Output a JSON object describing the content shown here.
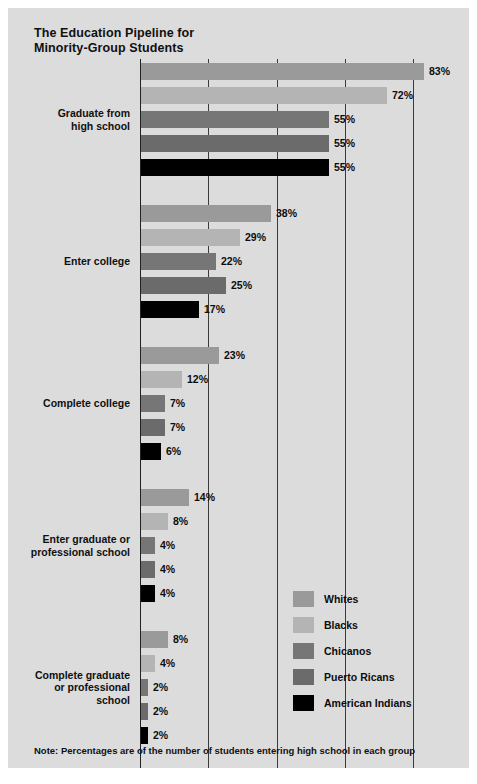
{
  "title": "The Education Pipeline for\nMinority-Group Students",
  "note": "Note: Percentages are of the number of students entering high school in each group",
  "legend": {
    "items": [
      {
        "label": "Whites",
        "color": "#9a9a9a"
      },
      {
        "label": "Blacks",
        "color": "#b4b4b4"
      },
      {
        "label": "Chicanos",
        "color": "#767676"
      },
      {
        "label": "Puerto Ricans",
        "color": "#6b6b6b"
      },
      {
        "label": "American Indians",
        "color": "#000000"
      }
    ]
  },
  "chart_data": {
    "type": "bar",
    "orientation": "horizontal",
    "title": "The Education Pipeline for Minority-Group Students",
    "xlabel": "Percent of Cohort",
    "ylabel": "",
    "xlim": [
      0,
      80
    ],
    "xticks": [
      0,
      20,
      40,
      60,
      80
    ],
    "xtick_labels": [
      "0",
      "20",
      "40",
      "60",
      "80"
    ],
    "grid": true,
    "legend_position": "bottom-right",
    "value_suffix": "%",
    "categories": [
      "Graduate from\nhigh school",
      "Enter college",
      "Complete college",
      "Enter graduate or\nprofessional school",
      "Complete graduate\nor professional\nschool"
    ],
    "series": [
      {
        "name": "Whites",
        "color": "#9a9a9a",
        "values": [
          83,
          38,
          23,
          14,
          8
        ]
      },
      {
        "name": "Blacks",
        "color": "#b4b4b4",
        "values": [
          72,
          29,
          12,
          8,
          4
        ]
      },
      {
        "name": "Chicanos",
        "color": "#767676",
        "values": [
          55,
          22,
          7,
          4,
          2
        ]
      },
      {
        "name": "Puerto Ricans",
        "color": "#6b6b6b",
        "values": [
          55,
          25,
          7,
          4,
          2
        ]
      },
      {
        "name": "American Indians",
        "color": "#000000",
        "values": [
          55,
          17,
          6,
          4,
          2
        ]
      }
    ],
    "value_labels": [
      [
        "83%",
        "72%",
        "55%",
        "55%",
        "55%"
      ],
      [
        "38%",
        "29%",
        "22%",
        "25%",
        "17%"
      ],
      [
        "23%",
        "12%",
        "7%",
        "7%",
        "6%"
      ],
      [
        "14%",
        "8%",
        "4%",
        "4%",
        "4%"
      ],
      [
        "8%",
        "4%",
        "2%",
        "2%",
        "2%"
      ]
    ]
  }
}
